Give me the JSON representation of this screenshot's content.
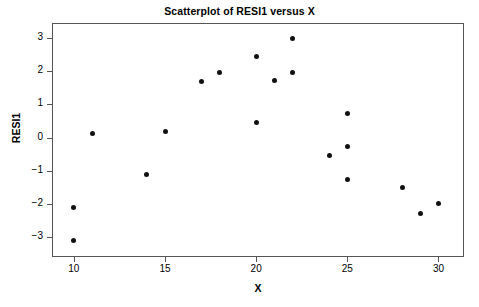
{
  "chart_data": {
    "type": "scatter",
    "title": "Scatterplot of RESI1 versus X",
    "xlabel": "X",
    "ylabel": "RESI1",
    "xlim": [
      8.8,
      31.4
    ],
    "ylim": [
      -3.6,
      3.45
    ],
    "grid": false,
    "legend": null,
    "xticks": [
      10,
      15,
      20,
      25,
      30
    ],
    "xtick_labels": [
      "10",
      "15",
      "20",
      "25",
      "30"
    ],
    "yticks": [
      3,
      2,
      1,
      0,
      -1,
      -2,
      -3
    ],
    "ytick_labels": [
      "3",
      "2",
      "1",
      "0",
      "−1",
      "−2",
      "−3"
    ],
    "marker": "filled-circle",
    "marker_color": "#111111",
    "frame_color": "#555555",
    "background_color": "#ffffff",
    "n_points": 20,
    "points": [
      {
        "x": 10,
        "y": -2.12
      },
      {
        "x": 10,
        "y": -3.11
      },
      {
        "x": 11,
        "y": 0.13
      },
      {
        "x": 14,
        "y": -1.1
      },
      {
        "x": 15,
        "y": 0.17
      },
      {
        "x": 17,
        "y": 1.7
      },
      {
        "x": 18,
        "y": 1.95
      },
      {
        "x": 20,
        "y": 2.45
      },
      {
        "x": 20,
        "y": 0.45
      },
      {
        "x": 21,
        "y": 1.71
      },
      {
        "x": 22,
        "y": 2.98
      },
      {
        "x": 22,
        "y": 1.97
      },
      {
        "x": 24,
        "y": -0.53
      },
      {
        "x": 25,
        "y": 0.73
      },
      {
        "x": 25,
        "y": -0.26
      },
      {
        "x": 25,
        "y": -1.27
      },
      {
        "x": 28,
        "y": -1.52
      },
      {
        "x": 29,
        "y": -2.28
      },
      {
        "x": 30,
        "y": -2.0
      }
    ]
  },
  "icons": {
    "point_marker": "filled-circle-marker"
  }
}
